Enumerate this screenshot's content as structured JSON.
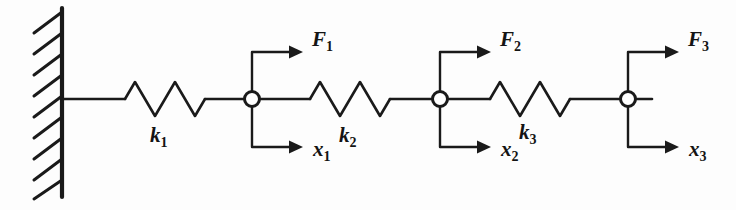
{
  "diagram": {
    "type": "mechanical-schematic",
    "background_color": "#fdfdfd",
    "line_color": "#1a1a1a",
    "wall": {
      "name": "fixed-support-wall",
      "hatch_count": 9,
      "x": 62,
      "y_top": 8,
      "y_bottom": 197
    },
    "baseline_y": 99,
    "springs": [
      {
        "label": "k",
        "subscript": "1",
        "x_start": 125,
        "x_end": 205,
        "label_x": 160,
        "label_y": 142,
        "coils": 4
      },
      {
        "label": "k",
        "subscript": "2",
        "x_start": 310,
        "x_end": 390,
        "label_x": 349,
        "label_y": 142,
        "coils": 4
      },
      {
        "label": "k",
        "subscript": "3",
        "x_start": 490,
        "x_end": 570,
        "label_x": 529,
        "label_y": 139,
        "coils": 4
      }
    ],
    "nodes": [
      {
        "name": "mass-node-1",
        "cx": 252,
        "cy": 99,
        "r": 7.5,
        "force": {
          "label": "F",
          "subscript": "1",
          "arrow_y": 52,
          "arrow_x_end": 300,
          "label_x": 311,
          "label_y": 45
        },
        "displacement": {
          "label": "x",
          "subscript": "1",
          "arrow_y": 147,
          "arrow_x_end": 300,
          "label_x": 311,
          "label_y": 155
        }
      },
      {
        "name": "mass-node-2",
        "cx": 440,
        "cy": 99,
        "r": 7.5,
        "force": {
          "label": "F",
          "subscript": "2",
          "arrow_y": 52,
          "arrow_x_end": 488,
          "label_x": 499,
          "label_y": 45
        },
        "displacement": {
          "label": "x",
          "subscript": "2",
          "arrow_y": 147,
          "arrow_x_end": 488,
          "label_x": 499,
          "label_y": 155
        }
      },
      {
        "name": "mass-node-3",
        "cx": 628,
        "cy": 99,
        "r": 7.5,
        "force": {
          "label": "F",
          "subscript": "3",
          "arrow_y": 52,
          "arrow_x_end": 676,
          "label_x": 687,
          "label_y": 45
        },
        "displacement": {
          "label": "x",
          "subscript": "3",
          "arrow_y": 147,
          "arrow_x_end": 676,
          "label_x": 687,
          "label_y": 155
        }
      }
    ],
    "labels": {
      "k1": "k",
      "k1_sub": "1",
      "k2": "k",
      "k2_sub": "2",
      "k3": "k",
      "k3_sub": "3",
      "F1": "F",
      "F1_sub": "1",
      "F2": "F",
      "F2_sub": "2",
      "F3": "F",
      "F3_sub": "3",
      "x1": "x",
      "x1_sub": "1",
      "x2": "x",
      "x2_sub": "2",
      "x3": "x",
      "x3_sub": "3"
    }
  }
}
